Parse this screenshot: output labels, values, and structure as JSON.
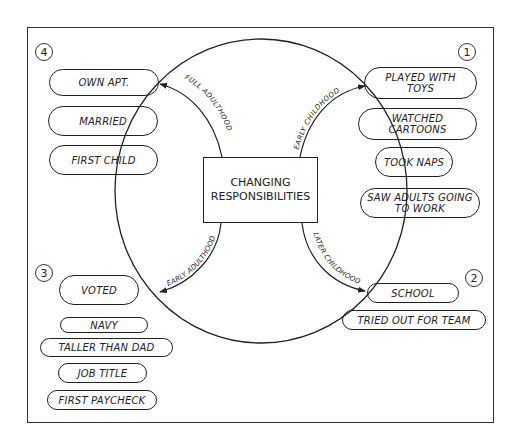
{
  "center": {
    "line1": "CHANGING",
    "line2": "RESPONSIBILITIES"
  },
  "stages": {
    "early_childhood": {
      "number": "1",
      "label": "EARLY CHILDHOOD",
      "items": [
        "PLAYED WITH TOYS",
        "WATCHED CARTOONS",
        "TOOK NAPS",
        "SAW ADULTS GOING TO WORK"
      ]
    },
    "later_childhood": {
      "number": "2",
      "label": "LATER CHILDHOOD",
      "items": [
        "SCHOOL",
        "TRIED OUT FOR TEAM"
      ]
    },
    "early_adulthood": {
      "number": "3",
      "label": "EARLY ADULTHOOD",
      "items": [
        "VOTED",
        "NAVY",
        "TALLER THAN DAD",
        "JOB TITLE",
        "FIRST PAYCHECK"
      ]
    },
    "full_adulthood": {
      "number": "4",
      "label": "FULL ADULTHOOD",
      "items": [
        "OWN APT.",
        "MARRIED",
        "FIRST CHILD"
      ]
    }
  },
  "colors": {
    "line": "#222222",
    "background": "#ffffff"
  }
}
